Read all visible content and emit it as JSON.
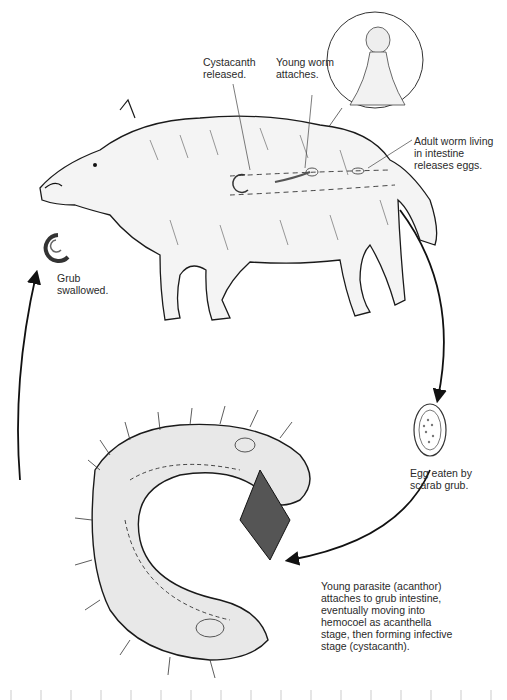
{
  "labels": {
    "cystacanth_released": "Cystacanth\nreleased.",
    "young_worm_attaches": "Young worm\nattaches.",
    "adult_worm": "Adult worm living\nin intestine\nreleases eggs.",
    "grub_swallowed": "Grub\nswallowed.",
    "egg_eaten": "Egg eaten by\nscarab grub.",
    "young_parasite": "Young parasite (acanthor)\nattaches to grub intestine,\neventually moving into\nhemocoel as acanthella\nstage, then forming infective\nstage (cystacanth)."
  },
  "figures": {
    "host": "wild-boar",
    "intermediate_host": "scarab-grub",
    "inset": "proboscis-detail",
    "egg": "acanthocephalan-egg"
  },
  "colors": {
    "line": "#1a1a1a",
    "text": "#2a2a2a",
    "background": "#ffffff"
  }
}
